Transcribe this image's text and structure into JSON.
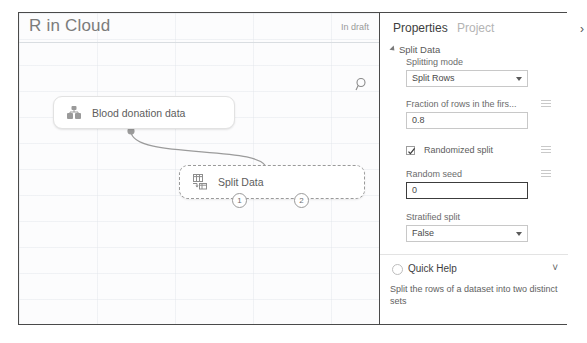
{
  "header": {
    "title": "R in Cloud",
    "status": "In draft"
  },
  "canvas": {
    "search_icon": "search-icon",
    "nodes": [
      {
        "id": "dataset",
        "label": "Blood donation data",
        "icon": "dataset-icon",
        "selected": false
      },
      {
        "id": "split-data",
        "label": "Split Data",
        "icon": "split-data-icon",
        "selected": true,
        "output_ports": [
          "1",
          "2"
        ]
      }
    ]
  },
  "properties": {
    "tabs": [
      {
        "label": "Properties",
        "active": true
      },
      {
        "label": "Project",
        "active": false
      }
    ],
    "collapse_icon": "chevron-right-icon",
    "section_title": "Split Data",
    "fields": [
      {
        "label": "Splitting mode",
        "value": "Split Rows",
        "type": "select",
        "focused": false,
        "has_range_icon": false
      },
      {
        "label": "Fraction of rows in the firs...",
        "value": "0.8",
        "type": "text",
        "focused": false,
        "has_range_icon": true
      },
      {
        "label": "Randomized split",
        "value": "",
        "type": "checkbox",
        "checked": true,
        "has_range_icon": true
      },
      {
        "label": "Random seed",
        "value": "0",
        "type": "text",
        "focused": true,
        "has_range_icon": true
      },
      {
        "label": "Stratified split",
        "value": "False",
        "type": "select",
        "focused": false,
        "has_range_icon": false
      }
    ]
  },
  "quick_help": {
    "title": "Quick Help",
    "icon": "help-circle-icon",
    "chevron": "chevron-down-icon",
    "text": "Split the rows of a dataset into two distinct sets"
  }
}
